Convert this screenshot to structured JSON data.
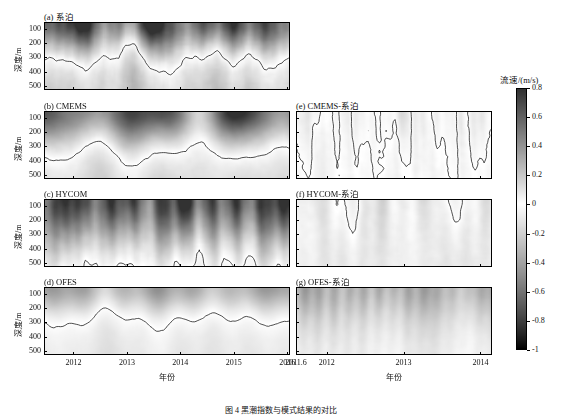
{
  "figure": {
    "caption": "图 4    黑潮指数与模式结果的对比",
    "caption_top": 404,
    "width": 562,
    "height": 419
  },
  "colorbar": {
    "title": "流速/(m/s)",
    "min": -1,
    "max": 0.8,
    "ticks": [
      "0.8",
      "0.6",
      "0.4",
      "0.2",
      "0",
      "-0.2",
      "-0.4",
      "-0.6",
      "-0.8",
      "-1"
    ],
    "tick_values": [
      0.8,
      0.6,
      0.4,
      0.2,
      0,
      -0.2,
      -0.4,
      -0.6,
      -0.8,
      -1
    ],
    "colormap": "gray-reversed",
    "color_low": "#000000",
    "color_high": "#ffffff"
  },
  "axes": {
    "ylabel": "深度/m",
    "yticks": [
      "100",
      "200",
      "300",
      "400",
      "500"
    ],
    "ytick_values": [
      100,
      200,
      300,
      400,
      500
    ],
    "ylim": [
      50,
      530
    ],
    "xlabel": "年份",
    "left_xticks": [
      "2012",
      "2013",
      "2014",
      "2015",
      "2016"
    ],
    "left_xlim": [
      2011.45,
      2016.05
    ],
    "right_xticks": [
      "2011.6",
      "2012",
      "2013",
      "2014"
    ],
    "right_xlim": [
      2011.6,
      2014.15
    ]
  },
  "panels": [
    {
      "id": "a",
      "label": "(a) 系泊",
      "column": "left",
      "series": "mooring",
      "title_text": "(a) 系泊"
    },
    {
      "id": "b",
      "label": "(b) CMEMS",
      "column": "left",
      "series": "cmems",
      "title_text": "(b) CMEMS"
    },
    {
      "id": "c",
      "label": "(c) HYCOM",
      "column": "left",
      "series": "hycom",
      "title_text": "(c) HYCOM"
    },
    {
      "id": "d",
      "label": "(d) OFES",
      "column": "left",
      "series": "ofes",
      "title_text": "(d) OFES"
    },
    {
      "id": "e",
      "label": "(e) CMEMS-系泊",
      "column": "right",
      "series": "cmems_diff",
      "title_text": "(e) CMEMS-系泊"
    },
    {
      "id": "f",
      "label": "(f) HYCOM-系泊",
      "column": "right",
      "series": "hycom_diff",
      "title_text": "(f) HYCOM-系泊"
    },
    {
      "id": "g",
      "label": "(g) OFES-系泊",
      "column": "right",
      "series": "ofes_diff",
      "title_text": "(g) OFES-系泊"
    }
  ],
  "chart_data": {
    "type": "heatmap",
    "title": "黑潮指数与模式结果的对比",
    "xlabel": "年份",
    "ylabel": "深度/m",
    "colorbar_label": "流速/(m/s)",
    "clim": [
      -1,
      0.8
    ],
    "contour_level": 0,
    "grid": false,
    "legend": "colorbar-right",
    "note": "Hovmoller depth-time sections of along-strait velocity; black contour marks the 0 m/s line. Left column: observed mooring and three models (2011.5-2016). Right column: model-minus-mooring differences (2011.6-2014.15).",
    "panels": [
      {
        "id": "a",
        "name": "系泊",
        "column": "left",
        "xlim": [
          2011.45,
          2016.05
        ],
        "ylim": [
          50,
          530
        ],
        "value_range": [
          -1.0,
          0.8
        ],
        "mean_profile_depths": [
          75,
          150,
          250,
          350,
          450,
          520
        ],
        "mean_profile_values": [
          0.55,
          0.38,
          0.18,
          0.02,
          -0.08,
          -0.12
        ],
        "description": "Strong banded surface-intensified flow; many dark (high-velocity) vertical stripes reaching 0.8 m/s near 60-150 m; zero contour fluctuates between 280 and 520 m."
      },
      {
        "id": "b",
        "name": "CMEMS",
        "column": "left",
        "xlim": [
          2011.45,
          2016.05
        ],
        "ylim": [
          50,
          530
        ],
        "value_range": [
          -1.0,
          0.8
        ],
        "mean_profile_depths": [
          75,
          150,
          250,
          350,
          450,
          520
        ],
        "mean_profile_values": [
          0.52,
          0.36,
          0.2,
          0.05,
          -0.04,
          -0.1
        ],
        "description": "Smoother banding than mooring; zero contour mostly between 300 and 500 m with frequent surfacing near 100 m."
      },
      {
        "id": "c",
        "name": "HYCOM",
        "column": "left",
        "xlim": [
          2011.45,
          2016.05
        ],
        "ylim": [
          50,
          530
        ],
        "value_range": [
          -1.0,
          0.8
        ],
        "mean_profile_depths": [
          75,
          150,
          250,
          350,
          450,
          520
        ],
        "mean_profile_values": [
          0.6,
          0.45,
          0.28,
          0.12,
          0.0,
          -0.06
        ],
        "description": "Deeper-reaching strong flow, broad dark regions extending to 400 m; zero contour deeper, near 400-520 m."
      },
      {
        "id": "d",
        "name": "OFES",
        "column": "left",
        "xlim": [
          2011.45,
          2016.05
        ],
        "ylim": [
          50,
          530
        ],
        "value_range": [
          -1.0,
          0.8
        ],
        "mean_profile_depths": [
          75,
          150,
          250,
          350,
          450,
          520
        ],
        "mean_profile_values": [
          0.3,
          0.18,
          0.05,
          -0.02,
          -0.05,
          -0.07
        ],
        "description": "Much weaker and smoother field, light gray overall; zero contour nearly flat around 250-320 m."
      },
      {
        "id": "e",
        "name": "CMEMS-系泊",
        "column": "right",
        "xlim": [
          2011.6,
          2014.15
        ],
        "ylim": [
          50,
          530
        ],
        "value_range": [
          -0.6,
          0.5
        ],
        "mean_profile_depths": [
          75,
          150,
          250,
          350,
          450,
          520
        ],
        "mean_profile_values": [
          -0.05,
          -0.02,
          0.02,
          0.03,
          0.02,
          0.01
        ],
        "description": "Difference field near zero (light); patchy positive and negative lobes; dense zero contours."
      },
      {
        "id": "f",
        "name": "HYCOM-系泊",
        "column": "right",
        "xlim": [
          2011.6,
          2014.15
        ],
        "ylim": [
          50,
          530
        ],
        "value_range": [
          -0.6,
          0.6
        ],
        "mean_profile_depths": [
          75,
          150,
          250,
          350,
          450,
          520
        ],
        "mean_profile_values": [
          0.05,
          0.07,
          0.1,
          0.1,
          0.07,
          0.04
        ],
        "description": "Mostly small positive bias with many closed zero contours; weak shading."
      },
      {
        "id": "g",
        "name": "OFES-系泊",
        "column": "right",
        "xlim": [
          2011.6,
          2014.15
        ],
        "ylim": [
          50,
          530
        ],
        "value_range": [
          -1.0,
          0.4
        ],
        "mean_profile_depths": [
          75,
          150,
          250,
          350,
          450,
          520
        ],
        "mean_profile_values": [
          -0.3,
          -0.25,
          -0.15,
          -0.07,
          -0.03,
          -0.02
        ],
        "description": "Strong negative bias: broad dark vertical bands at all depths, indicating OFES underestimates the current."
      }
    ]
  }
}
